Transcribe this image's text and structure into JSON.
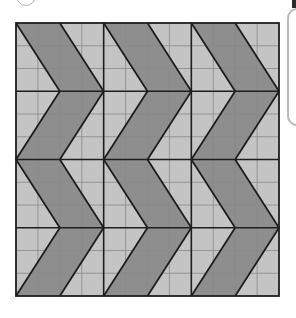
{
  "figure": {
    "grid": {
      "left": 16,
      "top": 23,
      "right": 279,
      "bottom": 296,
      "major_cols": 3,
      "major_rows": 4,
      "minor_per_col": 4,
      "minor_per_row": 3
    },
    "colors": {
      "dark_fill": "#8e8e8e",
      "light_fill": "#c4c4c4",
      "thick_line": "#1e1e1e",
      "thin_line": "#8a8a8a",
      "panel_border": "#b9b9b9"
    },
    "chevron_count": 3
  }
}
